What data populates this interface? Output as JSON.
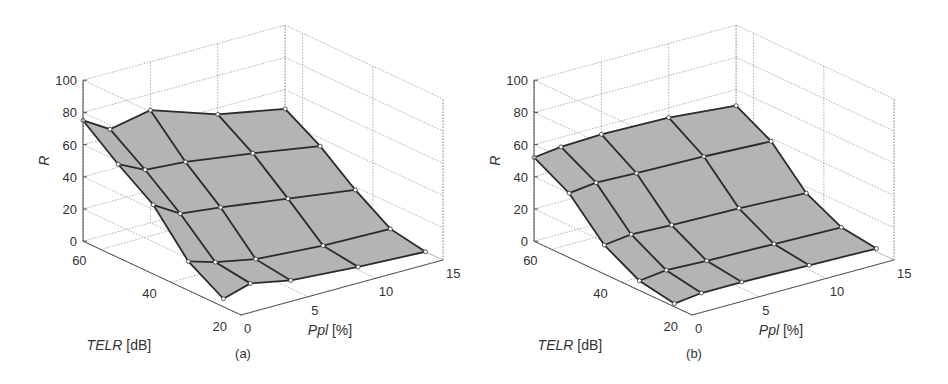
{
  "chart_data": [
    {
      "type": "surface3d",
      "panel_label": "(a)",
      "title": "",
      "xlabel": "Ppl [%]",
      "xlabel_italic_part": "Ppl",
      "xlabel_unit": "[%]",
      "ylabel": "TELR [dB]",
      "ylabel_italic_part": "TELR",
      "ylabel_unit": "[dB]",
      "zlabel": "R",
      "x_ticks": [
        "0",
        "5",
        "10",
        "15"
      ],
      "y_ticks": [
        "20",
        "40",
        "60"
      ],
      "z_ticks": [
        "0",
        "20",
        "40",
        "60",
        "80",
        "100"
      ],
      "xlim": [
        0,
        15
      ],
      "ylim": [
        20,
        65
      ],
      "zlim": [
        0,
        100
      ],
      "grid": true,
      "surface_color": "#b4b4b4",
      "line_color": "#2a2a2a",
      "Ppl": [
        0,
        2,
        5,
        10,
        15
      ],
      "TELR": [
        25,
        35,
        45,
        55,
        65
      ],
      "R": [
        [
          5,
          18,
          43,
          58,
          75
        ],
        [
          10,
          13,
          33,
          50,
          65
        ],
        [
          5,
          8,
          30,
          48,
          70
        ],
        [
          2,
          5,
          24,
          42,
          56
        ],
        [
          0,
          4,
          18,
          35,
          48
        ]
      ]
    },
    {
      "type": "surface3d",
      "panel_label": "(b)",
      "title": "",
      "xlabel": "Ppl [%]",
      "xlabel_italic_part": "Ppl",
      "xlabel_unit": "[%]",
      "ylabel": "TELR [dB]",
      "ylabel_italic_part": "TELR",
      "ylabel_unit": "[dB]",
      "zlabel": "R",
      "x_ticks": [
        "0",
        "5",
        "10",
        "15"
      ],
      "y_ticks": [
        "20",
        "40",
        "60"
      ],
      "z_ticks": [
        "0",
        "20",
        "40",
        "60",
        "80",
        "100"
      ],
      "xlim": [
        0,
        15
      ],
      "ylim": [
        20,
        65
      ],
      "zlim": [
        0,
        100
      ],
      "grid": true,
      "surface_color": "#b4b4b4",
      "line_color": "#2a2a2a",
      "Ppl": [
        0,
        2,
        5,
        10,
        15
      ],
      "TELR": [
        25,
        35,
        45,
        55,
        65
      ],
      "R": [
        [
          2,
          6,
          18,
          40,
          52
        ],
        [
          4,
          8,
          20,
          42,
          54
        ],
        [
          4,
          7,
          19,
          41,
          55
        ],
        [
          3,
          6,
          18,
          40,
          54
        ],
        [
          2,
          5,
          16,
          38,
          50
        ]
      ]
    }
  ]
}
